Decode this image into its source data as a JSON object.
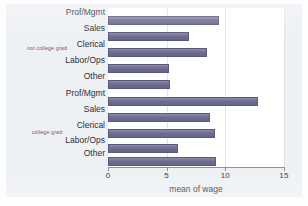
{
  "chart_data": {
    "type": "bar",
    "orientation": "horizontal",
    "title": "",
    "xlabel": "mean of wage",
    "ylabel": "",
    "xlim": [
      0,
      15
    ],
    "xticks": [
      0,
      5,
      10,
      15
    ],
    "xtick_labels": [
      "0",
      "5",
      "10",
      "15"
    ],
    "grid": true,
    "grid_axis": "x",
    "legend": "none",
    "bar_color": "#6C6B8E",
    "plot_background": "#FFFFFF",
    "figure_background": "#EEF1F4",
    "group_label_color": "#9C4F55",
    "groups": [
      {
        "name": "not college grad",
        "categories": [
          "Prof/Mgmt",
          "Sales",
          "Clerical",
          "Labor/Ops",
          "Other"
        ],
        "values": [
          9.5,
          6.9,
          8.4,
          5.2,
          5.3
        ]
      },
      {
        "name": "college grad",
        "categories": [
          "Prof/Mgmt",
          "Sales",
          "Clerical",
          "Labor/Ops",
          "Other"
        ],
        "values": [
          12.8,
          8.7,
          9.1,
          6.0,
          9.2
        ]
      }
    ]
  },
  "axis": {
    "x_title": "mean of wage",
    "ticks": [
      {
        "label": "0",
        "value": 0
      },
      {
        "label": "5",
        "value": 5
      },
      {
        "label": "10",
        "value": 10
      },
      {
        "label": "15",
        "value": 15
      }
    ]
  },
  "bars": [
    {
      "id": "g1-prof",
      "group": "not college grad",
      "label": "Prof/Mgmt",
      "value": 9.5
    },
    {
      "id": "g1-sales",
      "group": "not college grad",
      "label": "Sales",
      "value": 6.9
    },
    {
      "id": "g1-cler",
      "group": "not college grad",
      "label": "Clerical",
      "value": 8.4
    },
    {
      "id": "g1-labor",
      "group": "not college grad",
      "label": "Labor/Ops",
      "value": 5.2
    },
    {
      "id": "g1-other",
      "group": "not college grad",
      "label": "Other",
      "value": 5.3
    },
    {
      "id": "g2-prof",
      "group": "college grad",
      "label": "Prof/Mgmt",
      "value": 12.8
    },
    {
      "id": "g2-sales",
      "group": "college grad",
      "label": "Sales",
      "value": 8.7
    },
    {
      "id": "g2-cler",
      "group": "college grad",
      "label": "Clerical",
      "value": 9.1
    },
    {
      "id": "g2-labor",
      "group": "college grad",
      "label": "Labor/Ops",
      "value": 6.0
    },
    {
      "id": "g2-other",
      "group": "college grad",
      "label": "Other",
      "value": 9.2
    }
  ],
  "group_labels": [
    {
      "text": "not college grad"
    },
    {
      "text": "college grad"
    }
  ]
}
